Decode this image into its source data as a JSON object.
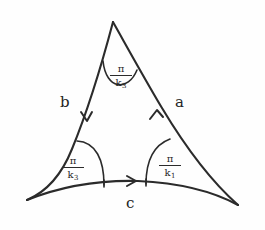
{
  "figure": {
    "ink_color": "#2b2b2b",
    "background_color": "#fefefe",
    "sides": [
      {
        "name": "a",
        "label": "a",
        "position": "right",
        "arrow_direction": "up-toward-apex"
      },
      {
        "name": "b",
        "label": "b",
        "position": "left",
        "arrow_direction": "down-toward-bottom-left"
      },
      {
        "name": "c",
        "label": "c",
        "position": "bottom",
        "arrow_direction": "right-toward-bottom-right"
      }
    ],
    "angles": [
      {
        "name": "apex-angle",
        "position": "top",
        "numerator": "π",
        "denominator": "k",
        "subscript": "3"
      },
      {
        "name": "bottom-left-angle",
        "position": "bottom-left",
        "numerator": "π",
        "denominator": "k",
        "subscript": "3"
      },
      {
        "name": "bottom-right-angle",
        "position": "bottom-right",
        "numerator": "π",
        "denominator": "k",
        "subscript": "1"
      }
    ]
  }
}
